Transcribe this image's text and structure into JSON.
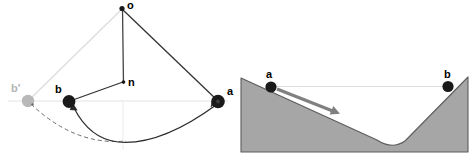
{
  "figure": {
    "title": "",
    "panels": [
      {
        "id": "pendulum-geometry",
        "kind": "vector-diagram",
        "labels": {
          "o": "o",
          "n": "n",
          "a": "a",
          "b": "b",
          "b_prime": "b'"
        },
        "points": {
          "o": {
            "x": 122,
            "y": 8
          },
          "n": {
            "x": 124,
            "y": 81
          },
          "a": {
            "x": 218,
            "y": 101
          },
          "b": {
            "x": 69,
            "y": 101
          },
          "b_prime": {
            "x": 28,
            "y": 101
          }
        },
        "colors": {
          "node_dark": "#1a1a1a",
          "node_muted": "#b3b3b3",
          "line_dark": "#333333",
          "line_muted": "#d9d9d9",
          "axis": "#e0e0e0"
        }
      },
      {
        "id": "valley-terrain",
        "kind": "terrain-schematic",
        "labels": {
          "a": "a",
          "b": "b"
        },
        "points": {
          "a": {
            "x": 34,
            "y": 87
          },
          "b": {
            "x": 211,
            "y": 86
          }
        },
        "colors": {
          "terrain_fill": "#a6a6a6",
          "terrain_stroke": "#4d4d4d",
          "node_dark": "#1a1a1a",
          "arrow": "#808080",
          "level_line": "#d9d9d9"
        },
        "arrow": {
          "from_x": 40,
          "from_y": 89,
          "to_x": 101,
          "to_y": 113
        }
      }
    ]
  }
}
